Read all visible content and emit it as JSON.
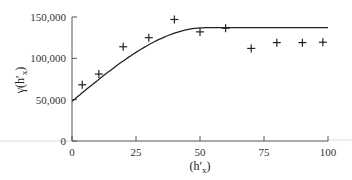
{
  "chart_data": {
    "type": "scatter",
    "title": "",
    "xlabel": "(h′x)",
    "xlabel_main": "(h′",
    "xlabel_sub": "x",
    "xlabel_close": ")",
    "ylabel": "γ(h′x)",
    "ylabel_main": "γ(h′",
    "ylabel_sub": "x",
    "ylabel_close": ")",
    "xlim": [
      0,
      100
    ],
    "ylim": [
      0,
      150000
    ],
    "x_ticks": [
      0,
      25,
      50,
      75,
      100
    ],
    "x_tick_labels": [
      "0",
      "25",
      "50",
      "75",
      "100"
    ],
    "y_ticks": [
      0,
      50000,
      100000,
      150000
    ],
    "y_tick_labels": [
      "0",
      "50,000",
      "100,000",
      "150,000"
    ],
    "grid": false,
    "legend": null,
    "series": [
      {
        "name": "experimental variogram",
        "marker": "+",
        "x": [
          4,
          10.5,
          20,
          30,
          40,
          50,
          60,
          70,
          80,
          90,
          98
        ],
        "y": [
          68000,
          81000,
          114000,
          125000,
          147000,
          132000,
          136500,
          112000,
          119000,
          119000,
          119500
        ]
      },
      {
        "name": "fitted model",
        "style": "line",
        "model": "spherical",
        "nugget": 48000,
        "sill": 137000,
        "range": 52,
        "x": [
          0,
          5,
          10,
          15,
          20,
          25,
          30,
          35,
          40,
          45,
          50,
          55,
          60,
          70,
          80,
          90,
          100
        ],
        "y": [
          48000,
          60700,
          73100,
          85000,
          96100,
          106200,
          115100,
          122500,
          128400,
          132600,
          135800,
          137000,
          137000,
          137000,
          137000,
          137000,
          137000
        ]
      }
    ]
  },
  "colors": {
    "axis": "#555555",
    "marker": "#222222",
    "line": "#222222",
    "artifact_line": "#d8d8d8"
  }
}
